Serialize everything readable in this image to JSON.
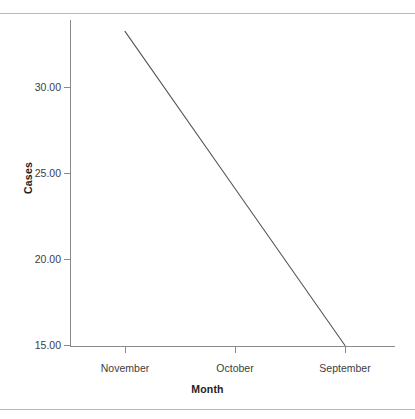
{
  "chart_data": {
    "type": "line",
    "title": "",
    "xlabel": "Month",
    "ylabel": "Cases",
    "categories": [
      "November",
      "October",
      "September"
    ],
    "x": [
      125,
      235,
      345
    ],
    "series": [
      {
        "name": "Cases",
        "values": [
          33.26,
          24.13,
          15.0
        ]
      }
    ],
    "ylim": [
      13.0,
      33.9
    ],
    "xlim": [
      70,
      395
    ],
    "yticks": [
      30.0,
      25.0,
      20.0,
      15.0
    ],
    "ytick_labels": [
      "30.00",
      "25.00",
      "20.00",
      "15.00"
    ],
    "xtick_labels": [
      "November",
      "October",
      "September"
    ],
    "grid": false,
    "legend": false,
    "legend_position": "none",
    "line_color": "#555555",
    "axis_color": "#8a8a8a",
    "text_color": "#3d3d3d",
    "background": "#ffffff",
    "annotations": []
  },
  "axes": {
    "y_title": "Cases",
    "x_title": "Month",
    "y_tick_labels": [
      "30.00",
      "25.00",
      "20.00",
      "15.00"
    ],
    "x_tick_labels": [
      "November",
      "October",
      "September"
    ]
  }
}
